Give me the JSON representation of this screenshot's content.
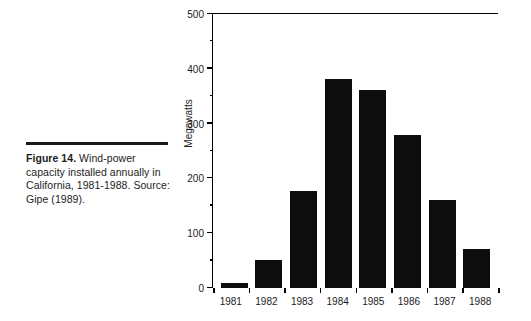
{
  "caption": {
    "figure_label": "Figure 14.",
    "body": " Wind-power capacity installed annually in California, 1981-1988. Source: Gipe (1989)."
  },
  "chart_data": {
    "type": "bar",
    "title": "",
    "xlabel": "",
    "ylabel": "Megawatts",
    "categories": [
      "1981",
      "1982",
      "1983",
      "1984",
      "1985",
      "1986",
      "1987",
      "1988"
    ],
    "values": [
      9,
      51,
      177,
      381,
      361,
      279,
      161,
      71
    ],
    "ylim": [
      0,
      500
    ],
    "y_major_ticks": [
      0,
      100,
      200,
      300,
      400,
      500
    ],
    "y_minor_ticks": [
      50,
      150,
      250,
      350,
      450
    ],
    "y_tick_labels": [
      "0",
      "100",
      "200",
      "300",
      "400",
      "500"
    ],
    "grid": false,
    "legend": "none",
    "bar_color": "#0d0d0d",
    "axis_color": "#000000"
  }
}
